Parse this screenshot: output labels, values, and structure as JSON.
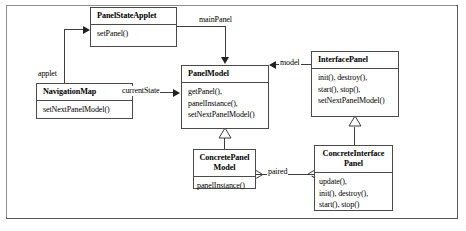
{
  "diagram": {
    "type": "uml-class-diagram",
    "classes": [
      {
        "id": "panel-state-applet",
        "name": "PanelStateApplet",
        "operations": [
          "setPanel()"
        ]
      },
      {
        "id": "navigation-map",
        "name": "NavigationMap",
        "operations": [
          "setNextPanelModel()"
        ]
      },
      {
        "id": "panel-model",
        "name": "PanelModel",
        "operations": [
          "getPanel(),",
          "panelInstance(),",
          "setNextPanelModel()"
        ]
      },
      {
        "id": "interface-panel",
        "name": "InterfacePanel",
        "operations": [
          "init(), destroy(),",
          "start(), stop(),",
          "setNextPanelModel()"
        ]
      },
      {
        "id": "concrete-panel-model",
        "name": "ConcretePanel\nModel",
        "operations": [
          "panelInstance()"
        ]
      },
      {
        "id": "concrete-interface-panel",
        "name": "ConcreteInterface\nPanel",
        "operations": [
          "update(),",
          "init(), destroy(),",
          "start(), stop()"
        ]
      }
    ],
    "edge_labels": [
      {
        "id": "main-panel",
        "text": "mainPanel"
      },
      {
        "id": "applet",
        "text": "applet"
      },
      {
        "id": "current-state",
        "text": "currentState"
      },
      {
        "id": "model",
        "text": "model"
      },
      {
        "id": "paired",
        "text": "paired"
      }
    ],
    "colors": {
      "line": "#3d3d3d",
      "box_border": "#4a4a4a",
      "frame_border": "#5a5a5a",
      "background": "#ffffff",
      "text": "#000000"
    }
  }
}
